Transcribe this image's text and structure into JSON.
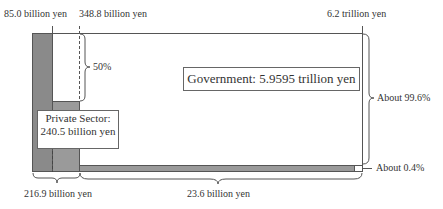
{
  "diagram": {
    "top_labels": {
      "left": "85.0 billion yen",
      "middle": "348.8 billion yen",
      "right": "6.2 trillion yen"
    },
    "government_box": "Government: 5.9595 trillion yen",
    "private_box": {
      "line1": "Private Sector:",
      "line2": "240.5 billion yen"
    },
    "brace_labels": {
      "half": "50%",
      "gov_share": "About 99.6%",
      "private_share": "About 0.4%",
      "bottom_left": "216.9 billion yen",
      "bottom_right": "23.6 billion yen"
    },
    "colors": {
      "dark_fill": "#8a8a8a",
      "mid_fill": "#9a9a9a",
      "line": "#555555",
      "background": "#ffffff"
    }
  }
}
